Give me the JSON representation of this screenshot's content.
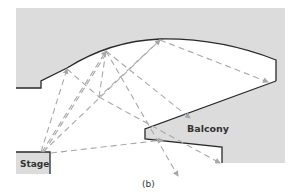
{
  "diagram": {
    "type": "auditorium-acoustics-cross-section",
    "labels": {
      "stage": "Stage",
      "balcony": "Balcony",
      "caption": "(b)"
    },
    "colors": {
      "fill": "#dcdcdc",
      "outline": "#2a2a2a",
      "rays": "#a8a8a8",
      "background": "#ffffff"
    },
    "rays": [
      {
        "from": "stage",
        "to": "ceiling-left",
        "reflect_to": "floor"
      },
      {
        "from": "stage",
        "to": "ceiling-mid",
        "reflect_to": "floor"
      },
      {
        "from": "stage",
        "to": "ceiling-top",
        "reflect_to": "balcony-rear"
      },
      {
        "from": "stage",
        "to": "ceiling-mid",
        "reflect_to": "under-balcony"
      },
      {
        "from": "stage",
        "to": "balcony-front",
        "direct": true
      }
    ]
  }
}
